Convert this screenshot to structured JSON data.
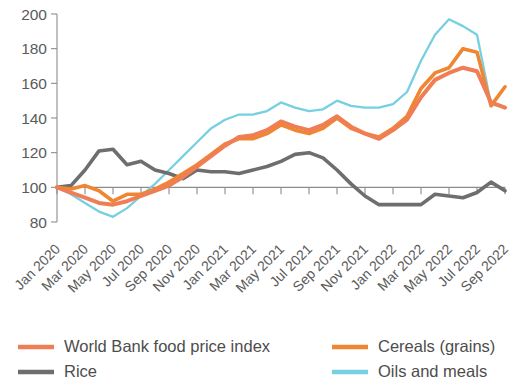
{
  "chart_data": {
    "type": "line",
    "title": "",
    "subtitle": "",
    "xlabel": "",
    "ylabel": "",
    "ylim": [
      80,
      200
    ],
    "ytick_values": [
      80,
      100,
      120,
      140,
      160,
      180,
      200
    ],
    "ytick_labels": [
      "80",
      "100",
      "120",
      "140",
      "160",
      "180",
      "200"
    ],
    "grid": false,
    "legend_position": "bottom",
    "baseline_value": 100,
    "x": [
      "Jan 2020",
      "Feb 2020",
      "Mar 2020",
      "Apr 2020",
      "May 2020",
      "Jun 2020",
      "Jul 2020",
      "Aug 2020",
      "Sep 2020",
      "Oct 2020",
      "Nov 2020",
      "Dec 2020",
      "Jan 2021",
      "Feb 2021",
      "Mar 2021",
      "Apr 2021",
      "May 2021",
      "Jun 2021",
      "Jul 2021",
      "Aug 2021",
      "Sep 2021",
      "Oct 2021",
      "Nov 2021",
      "Dec 2021",
      "Jan 2022",
      "Feb 2022",
      "Mar 2022",
      "Apr 2022",
      "May 2022",
      "Jun 2022",
      "Jul 2022",
      "Aug 2022",
      "Sep 2022"
    ],
    "xtick_labels": [
      "Jan 2020",
      "Mar 2020",
      "May 2020",
      "Jul 2020",
      "Sep 2020",
      "Nov 2020",
      "Jan 2021",
      "Mar 2021",
      "May 2021",
      "Jul 2021",
      "Sep 2021",
      "Nov 2021",
      "Jan 2022",
      "Mar 2022",
      "May 2022",
      "Jul 2022",
      "Sep 2022"
    ],
    "series": [
      {
        "name": "World Bank food price index",
        "color": "#F07E55",
        "values": [
          100,
          97,
          94,
          91,
          90,
          92,
          95,
          98,
          101,
          106,
          112,
          118,
          124,
          129,
          130,
          133,
          138,
          135,
          133,
          136,
          141,
          135,
          131,
          128,
          133,
          139,
          152,
          162,
          166,
          169,
          167,
          149,
          146
        ]
      },
      {
        "name": "Rice",
        "color": "#6E6E6E",
        "values": [
          100,
          101,
          110,
          121,
          122,
          113,
          115,
          110,
          108,
          105,
          110,
          109,
          109,
          108,
          110,
          112,
          115,
          119,
          120,
          117,
          110,
          102,
          95,
          90,
          90,
          90,
          90,
          96,
          95,
          94,
          97,
          103,
          98
        ]
      },
      {
        "name": "Cereals (grains)",
        "color": "#EF8732",
        "values": [
          100,
          99,
          101,
          98,
          92,
          96,
          96,
          99,
          103,
          108,
          113,
          119,
          125,
          128,
          128,
          131,
          136,
          133,
          131,
          134,
          140,
          134,
          131,
          129,
          134,
          141,
          157,
          166,
          169,
          180,
          178,
          147,
          158
        ]
      },
      {
        "name": "Oils and meals",
        "color": "#77CFE2",
        "values": [
          100,
          96,
          91,
          86,
          83,
          88,
          95,
          102,
          110,
          118,
          126,
          134,
          139,
          142,
          142,
          144,
          149,
          146,
          144,
          145,
          150,
          147,
          146,
          146,
          148,
          155,
          173,
          188,
          197,
          193,
          188,
          148,
          146
        ]
      }
    ]
  },
  "legend": {
    "entries": [
      {
        "label": "World Bank food price index",
        "color": "#F07E55",
        "swatch": "legend-swatch-line"
      },
      {
        "label": "Rice",
        "color": "#6E6E6E",
        "swatch": "legend-swatch-line"
      },
      {
        "label": "Cereals (grains)",
        "color": "#EF8732",
        "swatch": "legend-swatch-line"
      },
      {
        "label": "Oils and meals",
        "color": "#77CFE2",
        "swatch": "legend-swatch-line"
      }
    ]
  }
}
